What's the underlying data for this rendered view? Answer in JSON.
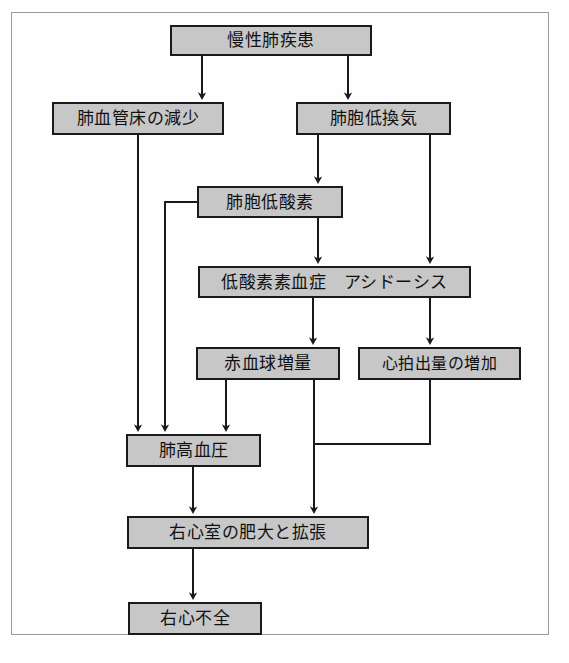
{
  "diagram": {
    "style": {
      "node_fill": "#c7c7c7",
      "node_border": "#1a1a1a",
      "connector_color": "#1a1a1a",
      "frame_border": "#9a9a9a",
      "background": "#ffffff"
    },
    "nodes": [
      {
        "id": "chronic-lung-disease",
        "label": "慢性肺疾患",
        "x": 170,
        "y": 25,
        "w": 202,
        "h": 31,
        "font_size": 17
      },
      {
        "id": "reduced-pulmonary-vascular-bed",
        "label": "肺血管床の減少",
        "x": 52,
        "y": 102,
        "w": 172,
        "h": 33,
        "font_size": 17
      },
      {
        "id": "alveolar-hypoventilation",
        "label": "肺胞低換気",
        "x": 296,
        "y": 102,
        "w": 155,
        "h": 33,
        "font_size": 17
      },
      {
        "id": "alveolar-hypoxia",
        "label": "肺胞低酸素",
        "x": 197,
        "y": 186,
        "w": 146,
        "h": 32,
        "font_size": 17
      },
      {
        "id": "hypoxemia-acidosis",
        "label": "低酸素素血症　アシドーシス",
        "x": 198,
        "y": 266,
        "w": 273,
        "h": 32,
        "font_size": 17
      },
      {
        "id": "erythrocytosis",
        "label": "赤血球増量",
        "x": 196,
        "y": 347,
        "w": 144,
        "h": 33,
        "font_size": 17
      },
      {
        "id": "increased-cardiac-output",
        "label": "心拍出量の増加",
        "x": 358,
        "y": 347,
        "w": 163,
        "h": 33,
        "font_size": 16
      },
      {
        "id": "pulmonary-hypertension",
        "label": "肺高血圧",
        "x": 126,
        "y": 434,
        "w": 135,
        "h": 33,
        "font_size": 17
      },
      {
        "id": "rv-hypertrophy-dilation",
        "label": "右心室の肥大と拡張",
        "x": 127,
        "y": 516,
        "w": 242,
        "h": 33,
        "font_size": 17
      },
      {
        "id": "right-heart-failure",
        "label": "右心不全",
        "x": 128,
        "y": 602,
        "w": 134,
        "h": 33,
        "font_size": 17
      }
    ],
    "connectors": [
      {
        "id": "c1",
        "from": "chronic-lung-disease",
        "to": "reduced-pulmonary-vascular-bed",
        "points": "202,56 202,96",
        "arrow": true
      },
      {
        "id": "c2",
        "from": "chronic-lung-disease",
        "to": "alveolar-hypoventilation",
        "points": "348,56 348,96",
        "arrow": true
      },
      {
        "id": "c3",
        "from": "alveolar-hypoventilation",
        "to": "alveolar-hypoxia",
        "points": "318,135 318,180",
        "arrow": true
      },
      {
        "id": "c4",
        "from": "alveolar-hypoventilation",
        "to": "hypoxemia-acidosis",
        "points": "430,135 430,260",
        "arrow": true
      },
      {
        "id": "c5",
        "from": "alveolar-hypoxia",
        "to": "hypoxemia-acidosis",
        "points": "318,218 318,260",
        "arrow": true
      },
      {
        "id": "c6",
        "from": "alveolar-hypoxia",
        "to": "pulmonary-hypertension",
        "points": "197,202 165,202 165,428",
        "arrow": true
      },
      {
        "id": "c7",
        "from": "reduced-pulmonary-vascular-bed",
        "to": "pulmonary-hypertension",
        "points": "138,135 138,428",
        "arrow": true
      },
      {
        "id": "c8",
        "from": "hypoxemia-acidosis",
        "to": "erythrocytosis",
        "points": "313,298 313,341",
        "arrow": true
      },
      {
        "id": "c9",
        "from": "hypoxemia-acidosis",
        "to": "increased-cardiac-output",
        "points": "430,298 430,341",
        "arrow": true
      },
      {
        "id": "c10",
        "from": "erythrocytosis",
        "to": "pulmonary-hypertension",
        "points": "226,380 226,428",
        "arrow": true
      },
      {
        "id": "c11",
        "from": "erythrocytosis",
        "to": "rv-hypertrophy-dilation",
        "points": "314,380 314,510",
        "arrow": true
      },
      {
        "id": "c12",
        "from": "increased-cardiac-output",
        "to": "rv-hypertrophy-dilation",
        "points": "430,380 430,444 314,444",
        "arrow": false
      },
      {
        "id": "c13",
        "from": "pulmonary-hypertension",
        "to": "rv-hypertrophy-dilation",
        "points": "193,467 193,510",
        "arrow": true
      },
      {
        "id": "c14",
        "from": "rv-hypertrophy-dilation",
        "to": "right-heart-failure",
        "points": "193,549 193,596",
        "arrow": true
      }
    ]
  }
}
